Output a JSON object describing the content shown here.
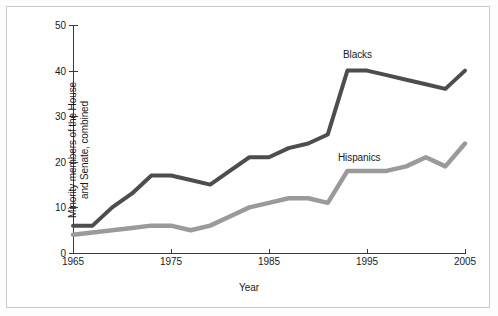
{
  "chart_data": {
    "type": "line",
    "title": "",
    "xlabel": "Year",
    "ylabel": "Minority members of the House\nand Senate, combined",
    "xlim": [
      1965,
      2005
    ],
    "ylim": [
      0,
      50
    ],
    "xticks": [
      1965,
      1975,
      1985,
      1995,
      2005
    ],
    "yticks": [
      0,
      10,
      20,
      30,
      40,
      50
    ],
    "grid": false,
    "legend_position": "inline-annotation",
    "x": [
      1965,
      1967,
      1969,
      1971,
      1973,
      1975,
      1977,
      1979,
      1981,
      1983,
      1985,
      1987,
      1989,
      1991,
      1993,
      1995,
      1997,
      1999,
      2001,
      2003,
      2005
    ],
    "series": [
      {
        "name": "Blacks",
        "color": "#4d4d4d",
        "values": [
          6,
          6,
          10,
          13,
          17,
          17,
          16,
          15,
          18,
          21,
          21,
          23,
          24,
          26,
          40,
          40,
          39,
          38,
          37,
          36,
          40
        ]
      },
      {
        "name": "Hispanics",
        "color": "#9a9a9a",
        "values": [
          4,
          4.5,
          5,
          5.5,
          6,
          6,
          5,
          6,
          8,
          10,
          11,
          12,
          12,
          11,
          18,
          18,
          18,
          19,
          21,
          19,
          24
        ]
      }
    ],
    "annotations": [
      {
        "text": "Blacks",
        "x": 1993,
        "y": 44
      },
      {
        "text": "Hispanics",
        "x": 1992,
        "y": 22
      }
    ]
  },
  "axis": {
    "y_tick_labels": [
      "0",
      "10",
      "20",
      "30",
      "40",
      "50"
    ],
    "x_tick_labels": [
      "1965",
      "1975",
      "1985",
      "1995",
      "2005"
    ],
    "x_title": "Year",
    "y_title": "Minority members of the House\nand Senate, combined"
  },
  "colors": {
    "blacks_line": "#4d4d4d",
    "hispanics_line": "#9a9a9a",
    "axis": "#3a3a3a",
    "frame_border": "#c9c9c9",
    "background": "#ffffff",
    "text": "#1a1a1a"
  }
}
